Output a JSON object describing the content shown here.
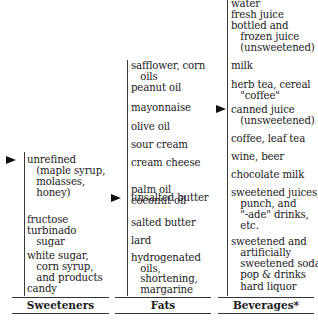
{
  "columns": [
    {
      "label": "Sweeteners",
      "items": [
        {
          "text": "unrefined\n   (maple syrup,\n   molasses,\n   honey)",
          "marked": true
        },
        {
          "text": "fructose\nturbinado\n   sugar"
        },
        {
          "text": "white sugar,\n   corn syrup,\n   and products\ncandy"
        }
      ]
    },
    {
      "label": "Fats",
      "items": [
        {
          "text": "safflower, corn\n   oils\npeanut oil"
        },
        {
          "text": "mayonnaise"
        },
        {
          "text": "olive oil"
        },
        {
          "text": "sour cream"
        },
        {
          "text": "cream cheese"
        },
        {
          "text": "unsalted butter",
          "marked": true
        },
        {
          "text": "palm oil\ncoconut oil"
        },
        {
          "text": "salted butter"
        },
        {
          "text": "lard"
        },
        {
          "text": "hydrogenated\n   oils,"
        },
        {
          "text": "   shortening,\n   margarine"
        }
      ]
    },
    {
      "label": "Beverages*",
      "items": [
        {
          "text": "water\nfresh juice\nbottled and\n   frozen juice\n   (unsweetened)"
        },
        {
          "text": "milk"
        },
        {
          "text": "herb tea, cereal\n   \"coffee\""
        },
        {
          "text": "canned juice\n   (unsweetened)",
          "marked": true
        },
        {
          "text": "coffee, leaf tea"
        },
        {
          "text": "wine, beer"
        },
        {
          "text": "chocolate milk"
        },
        {
          "text": "sweetened juices,\n   punch, and\n   \"-ade\" drinks,\n   etc."
        },
        {
          "text": "sweetened and\n   artificially\n   sweetened soda\n   pop & drinks"
        },
        {
          "text": "   hard liquor"
        }
      ]
    }
  ],
  "marker_icon": "right-pointing-triangle"
}
